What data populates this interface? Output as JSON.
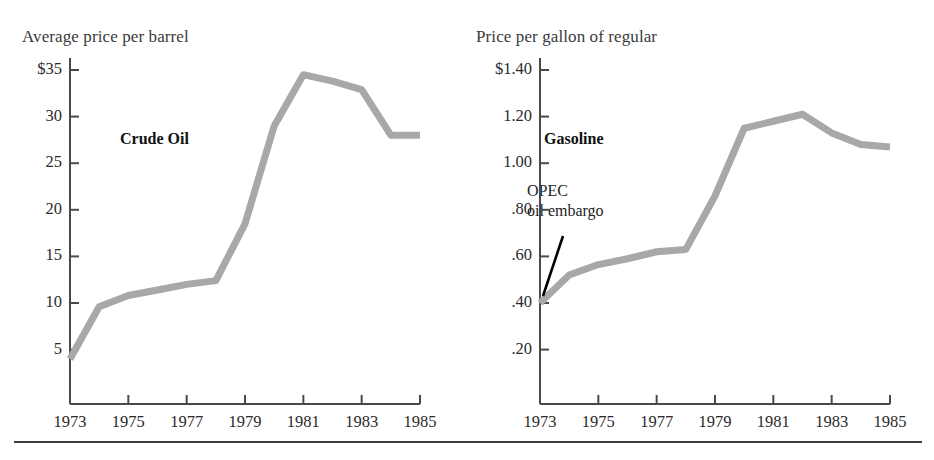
{
  "figure": {
    "bottom_rule": true,
    "line_color": "#a8a8a8",
    "axis_color": "#4a4a4a",
    "text_color": "#2b2b2b"
  },
  "panels": [
    {
      "id": "crude",
      "axis_title": "Average price per barrel",
      "series_label": "Crude Oil",
      "annotation": null,
      "y_ticks": [
        "$35",
        "30",
        "25",
        "20",
        "15",
        "10",
        "5"
      ],
      "x_ticks": [
        "1973",
        "1975",
        "1977",
        "1979",
        "1981",
        "1983",
        "1985"
      ]
    },
    {
      "id": "gasoline",
      "axis_title": "Price per gallon of regular",
      "series_label": "Gasoline",
      "annotation": [
        "OPEC",
        "oil embargo"
      ],
      "y_ticks": [
        "$1.40",
        "1.20",
        "1.00",
        ".80",
        ".60",
        ".40",
        ".20"
      ],
      "x_ticks": [
        "1973",
        "1975",
        "1977",
        "1979",
        "1981",
        "1983",
        "1985"
      ]
    }
  ],
  "chart_data": [
    {
      "type": "line",
      "title": "Crude Oil",
      "xlabel": "",
      "ylabel": "Average price per barrel",
      "x": [
        1973,
        1974,
        1975,
        1976,
        1977,
        1978,
        1979,
        1980,
        1981,
        1982,
        1983,
        1984,
        1985
      ],
      "values": [
        4.0,
        9.6,
        10.8,
        11.4,
        12.0,
        12.4,
        18.5,
        29.0,
        34.5,
        33.8,
        32.9,
        28.0,
        28.0
      ],
      "ylim": [
        0,
        35
      ],
      "xlim": [
        1973,
        1985
      ],
      "ytick_values": [
        35,
        30,
        25,
        20,
        15,
        10,
        5
      ],
      "ytick_labels": [
        "$35",
        "30",
        "25",
        "20",
        "15",
        "10",
        "5"
      ],
      "xtick_values": [
        1973,
        1975,
        1977,
        1979,
        1981,
        1983,
        1985
      ],
      "xtick_labels": [
        "1973",
        "1975",
        "1977",
        "1979",
        "1981",
        "1983",
        "1985"
      ],
      "grid": false,
      "legend": "none",
      "annotations": []
    },
    {
      "type": "line",
      "title": "Gasoline",
      "xlabel": "",
      "ylabel": "Price per gallon of regular",
      "x": [
        1973,
        1974,
        1975,
        1976,
        1977,
        1978,
        1979,
        1980,
        1981,
        1982,
        1983,
        1984,
        1985
      ],
      "values": [
        0.4,
        0.52,
        0.565,
        0.59,
        0.62,
        0.63,
        0.86,
        1.15,
        1.18,
        1.21,
        1.13,
        1.08,
        1.07
      ],
      "ylim": [
        0,
        1.4
      ],
      "xlim": [
        1973,
        1985
      ],
      "ytick_values": [
        1.4,
        1.2,
        1.0,
        0.8,
        0.6,
        0.4,
        0.2
      ],
      "ytick_labels": [
        "$1.40",
        "1.20",
        "1.00",
        ".80",
        ".60",
        ".40",
        ".20"
      ],
      "xtick_values": [
        1973,
        1975,
        1977,
        1979,
        1981,
        1983,
        1985
      ],
      "xtick_labels": [
        "1973",
        "1975",
        "1977",
        "1979",
        "1981",
        "1983",
        "1985"
      ],
      "grid": false,
      "legend": "none",
      "annotations": [
        {
          "text": "OPEC oil embargo",
          "points_to_x": 1973.4,
          "points_to_y": 0.44
        }
      ]
    }
  ]
}
